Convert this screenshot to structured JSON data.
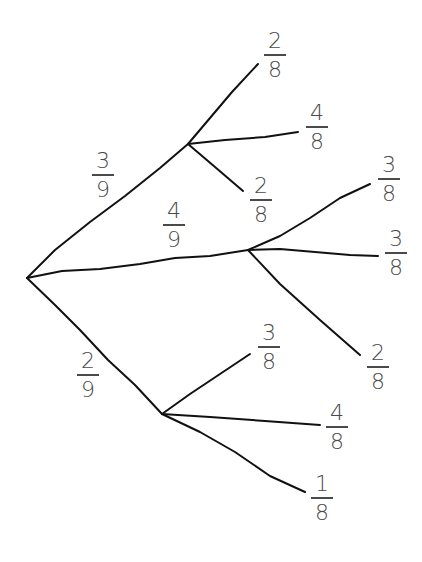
{
  "diagram": {
    "type": "probability-tree",
    "root": {
      "x": 27,
      "y": 278
    },
    "stroke_color": "#111111",
    "label_color": "#4a4a4a",
    "first_stage": [
      {
        "id": "A",
        "probability": {
          "numerator": "3",
          "denominator": "9"
        },
        "node": {
          "x": 188,
          "y": 144
        },
        "label_pos": {
          "x": 92,
          "y": 152
        },
        "children": [
          {
            "probability": {
              "numerator": "2",
              "denominator": "8"
            },
            "end": {
              "x": 258,
              "y": 64
            },
            "label_pos": {
              "x": 264,
              "y": 30
            }
          },
          {
            "probability": {
              "numerator": "4",
              "denominator": "8"
            },
            "end": {
              "x": 298,
              "y": 132
            },
            "label_pos": {
              "x": 306,
              "y": 104
            }
          },
          {
            "probability": {
              "numerator": "2",
              "denominator": "8"
            },
            "end": {
              "x": 243,
              "y": 191
            },
            "label_pos": {
              "x": 250,
              "y": 175
            }
          }
        ]
      },
      {
        "id": "B",
        "probability": {
          "numerator": "4",
          "denominator": "9"
        },
        "node": {
          "x": 248,
          "y": 250
        },
        "label_pos": {
          "x": 163,
          "y": 202
        },
        "children": [
          {
            "probability": {
              "numerator": "3",
              "denominator": "8"
            },
            "end": {
              "x": 370,
              "y": 184
            },
            "label_pos": {
              "x": 378,
              "y": 155
            }
          },
          {
            "probability": {
              "numerator": "3",
              "denominator": "8"
            },
            "end": {
              "x": 378,
              "y": 256
            },
            "label_pos": {
              "x": 386,
              "y": 228
            }
          },
          {
            "probability": {
              "numerator": "2",
              "denominator": "8"
            },
            "end": {
              "x": 360,
              "y": 355
            },
            "label_pos": {
              "x": 368,
              "y": 343
            }
          }
        ]
      },
      {
        "id": "C",
        "probability": {
          "numerator": "2",
          "denominator": "9"
        },
        "node": {
          "x": 162,
          "y": 414
        },
        "label_pos": {
          "x": 77,
          "y": 352
        },
        "children": [
          {
            "probability": {
              "numerator": "3",
              "denominator": "8"
            },
            "end": {
              "x": 250,
              "y": 354
            },
            "label_pos": {
              "x": 258,
              "y": 322
            }
          },
          {
            "probability": {
              "numerator": "4",
              "denominator": "8"
            },
            "end": {
              "x": 320,
              "y": 425
            },
            "label_pos": {
              "x": 326,
              "y": 403
            }
          },
          {
            "probability": {
              "numerator": "1",
              "denominator": "8"
            },
            "end": {
              "x": 305,
              "y": 492
            },
            "label_pos": {
              "x": 311,
              "y": 474
            }
          }
        ]
      }
    ]
  },
  "labels": {
    "a": {
      "num": "3",
      "den": "9"
    },
    "b": {
      "num": "4",
      "den": "9"
    },
    "c": {
      "num": "2",
      "den": "9"
    },
    "a1": {
      "num": "2",
      "den": "8"
    },
    "a2": {
      "num": "4",
      "den": "8"
    },
    "a3": {
      "num": "2",
      "den": "8"
    },
    "b1": {
      "num": "3",
      "den": "8"
    },
    "b2": {
      "num": "3",
      "den": "8"
    },
    "b3": {
      "num": "2",
      "den": "8"
    },
    "c1": {
      "num": "3",
      "den": "8"
    },
    "c2": {
      "num": "4",
      "den": "8"
    },
    "c3": {
      "num": "1",
      "den": "8"
    }
  }
}
